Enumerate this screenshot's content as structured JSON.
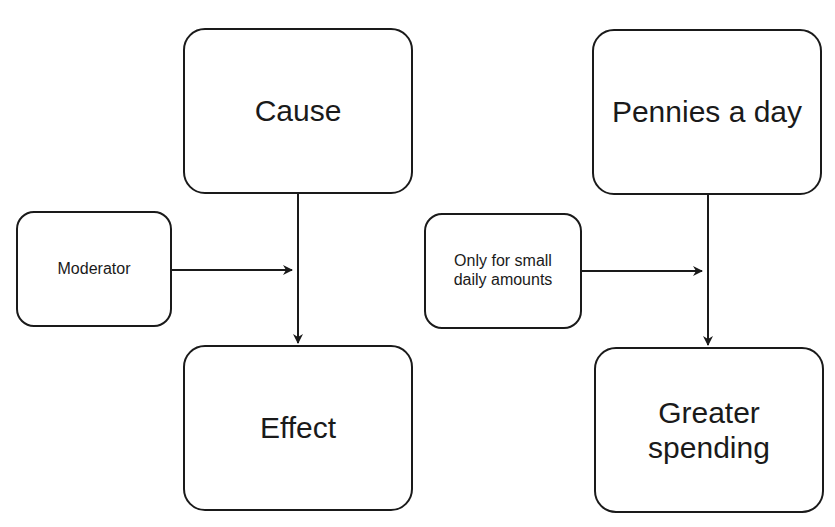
{
  "diagram": {
    "type": "moderation-model",
    "colors": {
      "stroke": "#1a1a1a",
      "background": "#ffffff"
    },
    "panels": [
      {
        "name": "generic",
        "cause": "Cause",
        "moderator": "Moderator",
        "effect": "Effect"
      },
      {
        "name": "example",
        "cause": "Pennies a day",
        "moderator": "Only for small daily amounts",
        "effect": "Greater spending"
      }
    ],
    "edges": [
      {
        "from": "Cause",
        "to": "Effect",
        "type": "arrow"
      },
      {
        "from": "Moderator",
        "to": "Cause→Effect path",
        "type": "arrow"
      },
      {
        "from": "Pennies a day",
        "to": "Greater spending",
        "type": "arrow"
      },
      {
        "from": "Only for small daily amounts",
        "to": "Pennies a day→Greater spending path",
        "type": "arrow"
      }
    ]
  }
}
